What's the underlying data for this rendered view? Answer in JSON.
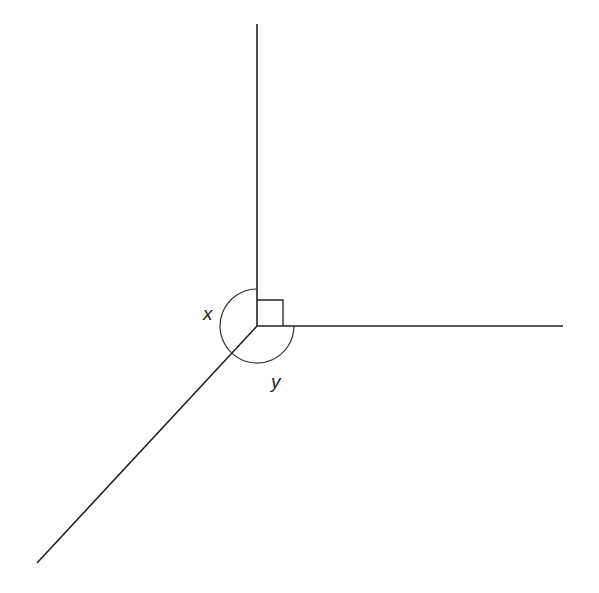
{
  "diagram": {
    "type": "angles-at-a-point",
    "vertex": {
      "x": 257,
      "y": 326
    },
    "rays": [
      {
        "name": "up",
        "to": {
          "x": 257,
          "y": 24
        }
      },
      {
        "name": "right",
        "to": {
          "x": 563,
          "y": 326
        }
      },
      {
        "name": "down-left",
        "to": {
          "x": 37,
          "y": 563
        }
      }
    ],
    "right_angle_marker": {
      "between": [
        "up",
        "right"
      ],
      "size": 26
    },
    "angles": [
      {
        "label": "x",
        "between": [
          "up",
          "down-left"
        ],
        "label_pos": {
          "x": 203,
          "y": 320
        }
      },
      {
        "label": "y",
        "between": [
          "down-left",
          "right"
        ],
        "label_pos": {
          "x": 271,
          "y": 388
        }
      }
    ],
    "arc_radius": 37
  }
}
